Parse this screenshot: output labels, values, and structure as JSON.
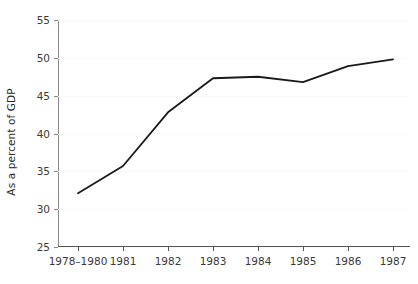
{
  "chart_data": {
    "type": "line",
    "title": "",
    "subtitle": "",
    "xlabel": "",
    "ylabel": "As a percent of GDP",
    "categories": [
      "1978–1980",
      "1981",
      "1982",
      "1983",
      "1984",
      "1985",
      "1986",
      "1987"
    ],
    "series": [
      {
        "name": "As a percent of GDP",
        "values": [
          32.1,
          35.7,
          42.8,
          47.3,
          47.5,
          46.8,
          48.9,
          49.8
        ],
        "color": "#1a1a1a",
        "line_width": 1.8,
        "markers": false
      }
    ],
    "ylim": [
      25,
      55
    ],
    "yticks": [
      25,
      30,
      35,
      40,
      45,
      50,
      55
    ],
    "ytick_labels": [
      "25",
      "30",
      "35",
      "40",
      "45",
      "50",
      "55"
    ],
    "xtick_labels": [
      "1978–1980",
      "1981",
      "1982",
      "1983",
      "1984",
      "1985",
      "1986",
      "1987"
    ],
    "grid": true,
    "grid_axis": "y",
    "grid_color": "#fafafa",
    "legend": false,
    "legend_position": "none",
    "background_color": "#ffffff",
    "axis_color": "#555555",
    "tick_label_color": "#3a3a3a"
  }
}
